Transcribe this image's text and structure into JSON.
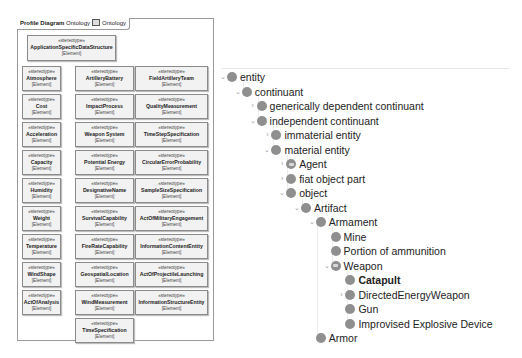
{
  "diagram": {
    "tab": {
      "kind_label": "Profile Diagram",
      "name_label": "Ontology",
      "package_label": "Ontology"
    },
    "root_box": {
      "stereotype": "«stereotype»",
      "name": "ApplicationSpecificDataStructure",
      "metaclass": "[Element]"
    },
    "columns": [
      {
        "boxes": [
          {
            "stereotype": "«stereotype»",
            "name": "Atmosphere",
            "metaclass": "[Element]"
          },
          {
            "stereotype": "«stereotype»",
            "name": "Cost",
            "metaclass": "[Element]"
          },
          {
            "stereotype": "«stereotype»",
            "name": "Acceleration",
            "metaclass": "[Element]"
          },
          {
            "stereotype": "«stereotype»",
            "name": "Capacity",
            "metaclass": "[Element]"
          },
          {
            "stereotype": "«stereotype»",
            "name": "Humidity",
            "metaclass": "[Element]"
          },
          {
            "stereotype": "«stereotype»",
            "name": "Weight",
            "metaclass": "[Element]"
          },
          {
            "stereotype": "«stereotype»",
            "name": "Temperature",
            "metaclass": "[Element]"
          },
          {
            "stereotype": "«stereotype»",
            "name": "WindShape",
            "metaclass": "[Element]"
          },
          {
            "stereotype": "«stereotype»",
            "name": "ActOfAnalysis",
            "metaclass": "[Element]"
          }
        ]
      },
      {
        "boxes": [
          {
            "stereotype": "«stereotype»",
            "name": "ArtilleryBattery",
            "metaclass": "[Element]"
          },
          {
            "stereotype": "«stereotype»",
            "name": "ImpactProcess",
            "metaclass": "[Element]"
          },
          {
            "stereotype": "«stereotype»",
            "name": "Weapon System",
            "metaclass": "[Element]"
          },
          {
            "stereotype": "«stereotype»",
            "name": "Potential Energy",
            "metaclass": "[Element]"
          },
          {
            "stereotype": "«stereotype»",
            "name": "DesignativeName",
            "metaclass": "[Element]"
          },
          {
            "stereotype": "«stereotype»",
            "name": "SurvivalCapability",
            "metaclass": "[Element]"
          },
          {
            "stereotype": "«stereotype»",
            "name": "FireRateCapability",
            "metaclass": "[Element]"
          },
          {
            "stereotype": "«stereotype»",
            "name": "GeospatialLocation",
            "metaclass": "[Element]"
          },
          {
            "stereotype": "«stereotype»",
            "name": "WindMeasurement",
            "metaclass": "[Element]"
          },
          {
            "stereotype": "«stereotype»",
            "name": "TimeSpecification",
            "metaclass": "[Element]"
          }
        ]
      },
      {
        "boxes": [
          {
            "stereotype": "«stereotype»",
            "name": "FieldArtilleryTeam",
            "metaclass": "[Element]"
          },
          {
            "stereotype": "«stereotype»",
            "name": "QualityMeasurement",
            "metaclass": "[Element]"
          },
          {
            "stereotype": "«stereotype»",
            "name": "TimeStepSpecification",
            "metaclass": "[Element]"
          },
          {
            "stereotype": "«stereotype»",
            "name": "CircularErrorProbability",
            "metaclass": "[Element]"
          },
          {
            "stereotype": "«stereotype»",
            "name": "SampleSizeSpecification",
            "metaclass": "[Element]"
          },
          {
            "stereotype": "«stereotype»",
            "name": "ActOfMilitaryEngagement",
            "metaclass": "[Element]"
          },
          {
            "stereotype": "«stereotype»",
            "name": "InformationContentEntity",
            "metaclass": "[Element]"
          },
          {
            "stereotype": "«stereotype»",
            "name": "ActOfProjectileLaunching",
            "metaclass": "[Element]"
          },
          {
            "stereotype": "«stereotype»",
            "name": "InformationStructureEntity",
            "metaclass": "[Element]"
          }
        ]
      }
    ]
  },
  "tree": {
    "nodes": [
      {
        "label": "entity",
        "level": 0,
        "toggle": "expanded",
        "icon": "class-icon"
      },
      {
        "label": "continuant",
        "level": 1,
        "toggle": "expanded",
        "icon": "class-icon"
      },
      {
        "label": "generically dependent continuant",
        "level": 2,
        "toggle": "collapsed",
        "icon": "class-icon"
      },
      {
        "label": "independent continuant",
        "level": 2,
        "toggle": "expanded",
        "icon": "class-icon"
      },
      {
        "label": "immaterial entity",
        "level": 3,
        "toggle": "collapsed",
        "icon": "class-icon"
      },
      {
        "label": "material entity",
        "level": 3,
        "toggle": "expanded",
        "icon": "class-icon"
      },
      {
        "label": "Agent",
        "level": 4,
        "toggle": "collapsed",
        "icon": "defined-class-icon"
      },
      {
        "label": "fiat object part",
        "level": 4,
        "toggle": "collapsed",
        "icon": "class-icon"
      },
      {
        "label": "object",
        "level": 4,
        "toggle": "expanded",
        "icon": "class-icon"
      },
      {
        "label": "Artifact",
        "level": 5,
        "toggle": "expanded",
        "icon": "class-icon"
      },
      {
        "label": "Armament",
        "level": 6,
        "toggle": "expanded",
        "icon": "class-icon"
      },
      {
        "label": "Mine",
        "level": 7,
        "toggle": "none",
        "icon": "class-icon"
      },
      {
        "label": "Portion of ammunition",
        "level": 7,
        "toggle": "none",
        "icon": "class-icon"
      },
      {
        "label": "Weapon",
        "level": 7,
        "toggle": "expanded",
        "icon": "defined-class-icon"
      },
      {
        "label": "Catapult",
        "level": 8,
        "toggle": "none",
        "icon": "class-icon",
        "bold": true
      },
      {
        "label": "DirectedEnergyWeapon",
        "level": 8,
        "toggle": "collapsed",
        "icon": "class-icon"
      },
      {
        "label": "Gun",
        "level": 8,
        "toggle": "none",
        "icon": "class-icon"
      },
      {
        "label": "Improvised Explosive Device",
        "level": 8,
        "toggle": "none",
        "icon": "class-icon"
      },
      {
        "label": "Armor",
        "level": 6,
        "toggle": "none",
        "icon": "class-icon"
      }
    ],
    "glyphs": {
      "expanded": "⌄",
      "collapsed": "›",
      "none": ""
    }
  },
  "colors": {
    "box_fill": "#f2f2f2",
    "box_border": "#8a8a8a",
    "tree_dot": "#8f8f8f",
    "text": "#222222"
  }
}
